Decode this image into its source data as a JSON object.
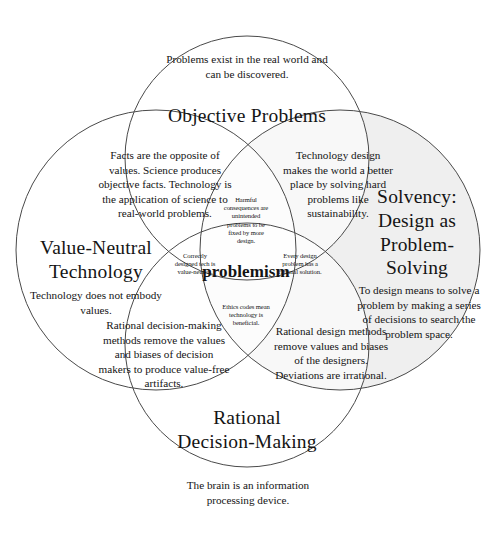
{
  "diagram": {
    "type": "four-set-venn",
    "center_term": "problemism",
    "colors": {
      "stroke": "#4a4a4a",
      "shaded_fill": "#eeeeee",
      "text": "#141414",
      "background": "#ffffff"
    },
    "circles": [
      {
        "id": "objective-problems",
        "position": "top",
        "title": "Objective Problems",
        "blurb": "Problems exist in the real world and can be discovered.",
        "shaded": false
      },
      {
        "id": "value-neutral-technology",
        "position": "left",
        "title": "Value-Neutral Technology",
        "blurb": "Technology does not embody values.",
        "shaded": false
      },
      {
        "id": "solvency-design-as-problem-solving",
        "position": "right",
        "title": "Solvency: Design as Problem-Solving",
        "blurb": "To design means to solve a problem by making a series of decisions to search the problem space.",
        "shaded": true
      },
      {
        "id": "rational-decision-making",
        "position": "bottom",
        "title": "Rational Decision-Making",
        "blurb": "The brain is an information processing device.",
        "shaded": false
      }
    ],
    "overlaps": [
      {
        "id": "top-left-overlap",
        "sets": [
          "Objective Problems",
          "Value-Neutral Technology"
        ],
        "text": "Facts are the opposite of values. Science produces objective facts. Technology is the application of science to real-world problems."
      },
      {
        "id": "top-right-overlap",
        "sets": [
          "Objective Problems",
          "Solvency: Design as Problem-Solving"
        ],
        "text": "Technology design makes the world a better place by solving hard problems like sustainability."
      },
      {
        "id": "bottom-left-overlap",
        "sets": [
          "Value-Neutral Technology",
          "Rational Decision-Making"
        ],
        "text": "Rational decision-making methods remove the values and biases of decision makers to produce value-free artifacts."
      },
      {
        "id": "bottom-right-overlap",
        "sets": [
          "Rational Decision-Making",
          "Solvency: Design as Problem-Solving"
        ],
        "text": "Rational design methods remove values and biases of the designers. Deviations are irrational."
      },
      {
        "id": "upper-petal",
        "sets": [
          "Objective Problems",
          "Value-Neutral Technology",
          "Solvency: Design as Problem-Solving"
        ],
        "text": "Harmful consequences are unintended problems to be fixed by more design."
      },
      {
        "id": "left-petal",
        "sets": [
          "Value-Neutral Technology",
          "Objective Problems",
          "Rational Decision-Making"
        ],
        "text": "Correctly designed tech is value-neutral."
      },
      {
        "id": "right-petal",
        "sets": [
          "Solvency: Design as Problem-Solving",
          "Objective Problems",
          "Rational Decision-Making"
        ],
        "text": "Every design problem has a rational solution."
      },
      {
        "id": "lower-petal",
        "sets": [
          "Rational Decision-Making",
          "Value-Neutral Technology",
          "Solvency: Design as Problem-Solving"
        ],
        "text": "Ethics codes mean technology is beneficial."
      }
    ]
  }
}
